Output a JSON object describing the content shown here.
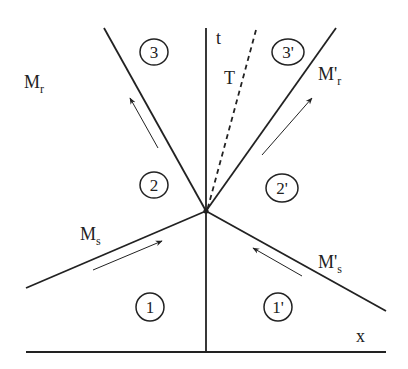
{
  "diagram": {
    "type": "space-time wave interaction diagram",
    "axes": {
      "vertical_label": "t",
      "horizontal_label": "x"
    },
    "lines": {
      "reflected_left": {
        "main": "M",
        "sub": "r",
        "style": "solid"
      },
      "reflected_right": {
        "main": "M'",
        "sub": "r",
        "style": "solid"
      },
      "transmitted": {
        "main": "T",
        "style": "dashed"
      },
      "incident_left": {
        "main": "M",
        "sub": "s",
        "style": "solid"
      },
      "incident_right": {
        "main": "M'",
        "sub": "s",
        "style": "solid"
      }
    },
    "regions": [
      {
        "id": "1",
        "label": "1"
      },
      {
        "id": "1p",
        "label": "1'"
      },
      {
        "id": "2",
        "label": "2"
      },
      {
        "id": "2p",
        "label": "2'"
      },
      {
        "id": "3",
        "label": "3"
      },
      {
        "id": "3p",
        "label": "3'"
      }
    ],
    "colors": {
      "stroke": "#222222",
      "background": "#ffffff"
    }
  }
}
